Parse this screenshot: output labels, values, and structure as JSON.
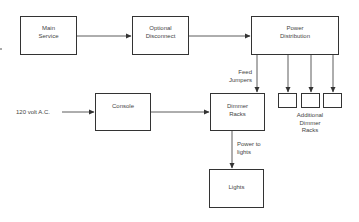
{
  "diagram": {
    "nodes": {
      "main_service": "Main\nService",
      "optional_disconnect": "Optional\nDisconnect",
      "power_distribution": "Power\nDistribution",
      "console": "Console",
      "dimmer_racks": "Dimmer\nRacks",
      "lights": "Lights"
    },
    "labels": {
      "input_120v": "120 volt A.C.",
      "feed_jumpers": "Feed\nJumpers",
      "power_to_lights": "Power to\nlights",
      "additional_dimmer_racks": "Additional\nDimmer\nRacks"
    },
    "edges": [
      {
        "from": "main_service",
        "to": "optional_disconnect"
      },
      {
        "from": "optional_disconnect",
        "to": "power_distribution"
      },
      {
        "from": "power_distribution",
        "to": "dimmer_racks",
        "label": "Feed Jumpers"
      },
      {
        "from": "power_distribution",
        "to": "additional_rack_1"
      },
      {
        "from": "power_distribution",
        "to": "additional_rack_2"
      },
      {
        "from": "power_distribution",
        "to": "additional_rack_3"
      },
      {
        "from": "input_120v",
        "to": "console"
      },
      {
        "from": "console",
        "to": "dimmer_racks"
      },
      {
        "from": "dimmer_racks",
        "to": "lights",
        "label": "Power to lights"
      }
    ],
    "line_color": "#333333"
  }
}
